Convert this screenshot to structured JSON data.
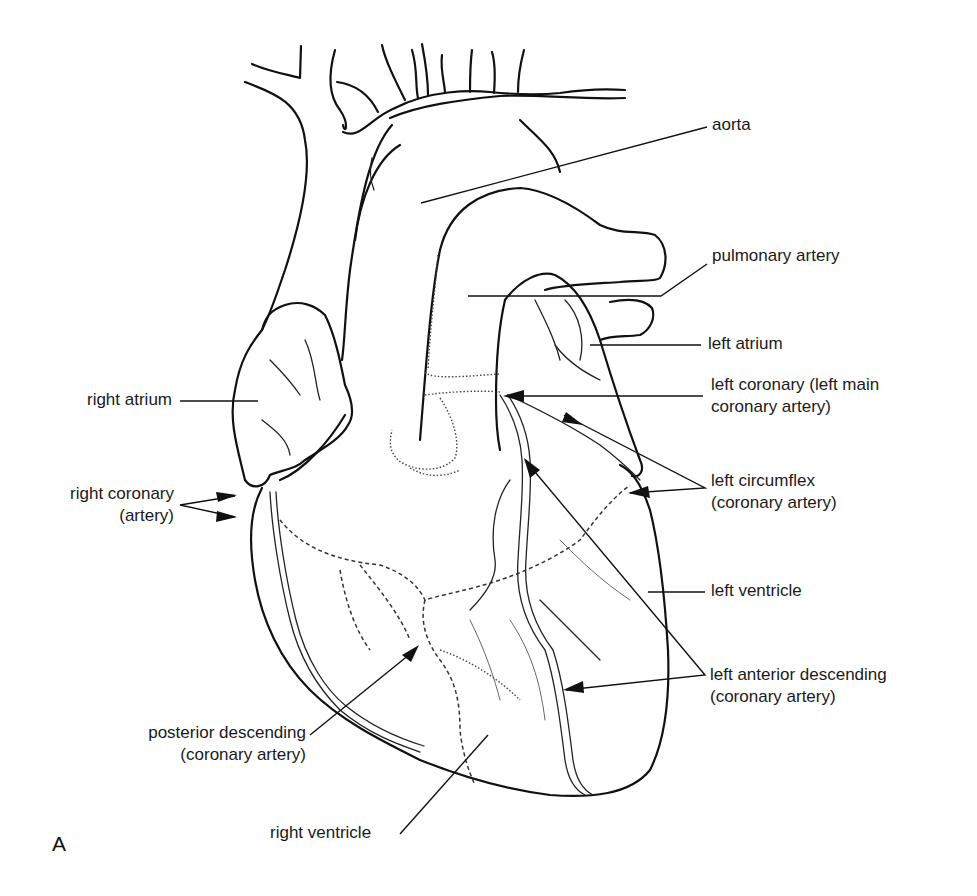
{
  "figure": {
    "panel_label": "A",
    "labels": {
      "aorta": "aorta",
      "pulmonary_artery": "pulmonary artery",
      "left_atrium": "left atrium",
      "left_coronary_line1": "left coronary (left main",
      "left_coronary_line2": "coronary artery)",
      "right_atrium": "right atrium",
      "right_coronary_line1": "right coronary",
      "right_coronary_line2": "(artery)",
      "left_circumflex_line1": "left circumflex",
      "left_circumflex_line2": "(coronary artery)",
      "left_ventricle": "left ventricle",
      "lad_line1": "left anterior descending",
      "lad_line2": "(coronary artery)",
      "posterior_descending_line1": "posterior descending",
      "posterior_descending_line2": "(coronary artery)",
      "right_ventricle": "right ventricle"
    }
  }
}
